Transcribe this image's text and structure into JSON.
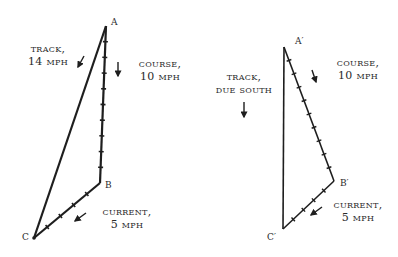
{
  "figure": {
    "left_diagram": {
      "points": {
        "A": {
          "label": "A",
          "x": 106,
          "y": 26
        },
        "B": {
          "label": "B",
          "x": 100,
          "y": 183
        },
        "C": {
          "label": "C",
          "x": 34,
          "y": 238
        }
      },
      "labels": {
        "track_line1": "TRACK,",
        "track_line2": "14 MPH",
        "course_line1": "COURSE,",
        "course_line2": "10 MPH",
        "current_line1": "CURRENT,",
        "current_line2": "5 MPH"
      },
      "vectors": [
        {
          "name": "course",
          "from": "A",
          "to": "B",
          "speed_mph": 10,
          "ticks": 10
        },
        {
          "name": "current",
          "from": "B",
          "to": "C",
          "speed_mph": 5,
          "ticks": 5
        },
        {
          "name": "track",
          "from": "A",
          "to": "C",
          "speed_mph": 14,
          "ticks": 0
        }
      ]
    },
    "right_diagram": {
      "points": {
        "A": {
          "label": "A′",
          "x": 284,
          "y": 47
        },
        "B": {
          "label": "B′",
          "x": 334,
          "y": 181
        },
        "C": {
          "label": "C′",
          "x": 283,
          "y": 229
        }
      },
      "labels": {
        "track_line1": "TRACK,",
        "track_line2": "DUE SOUTH",
        "course_line1": "COURSE,",
        "course_line2": "10 MPH",
        "current_line1": "CURRENT,",
        "current_line2": "5 MPH"
      },
      "vectors": [
        {
          "name": "course",
          "from": "A′",
          "to": "B′",
          "speed_mph": 10,
          "ticks": 10
        },
        {
          "name": "current",
          "from": "B′",
          "to": "C′",
          "speed_mph": 5,
          "ticks": 5
        },
        {
          "name": "track",
          "from": "A′",
          "to": "C′",
          "direction": "due south",
          "ticks": 0
        }
      ]
    },
    "colors": {
      "ink": "#1e1e1e",
      "background": "#ffffff"
    }
  }
}
